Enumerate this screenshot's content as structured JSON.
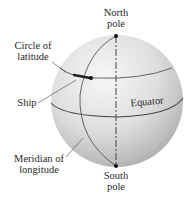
{
  "labels": {
    "north_pole": [
      "North",
      "pole"
    ],
    "south_pole": [
      "South",
      "pole"
    ],
    "circle_of_latitude": [
      "Circle of",
      "latitude"
    ],
    "ship": "Ship",
    "equator": "Equator",
    "meridian": [
      "Meridian of",
      "longitude"
    ]
  },
  "colors": {
    "sphere_light": "#f4f4f4",
    "sphere_mid": "#d9d9d9",
    "sphere_dark": "#a9a9a9",
    "line": "#4a4a4a",
    "point": "#111111",
    "text": "#2a2a2a"
  }
}
